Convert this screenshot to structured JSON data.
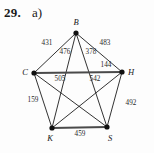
{
  "problem": {
    "number": "29.",
    "part": "a)"
  },
  "chart_data": {
    "type": "diagram",
    "title": "",
    "subtype": "weighted-complete-graph-K5",
    "vertices": [
      {
        "id": "B",
        "label": "B",
        "x": 76,
        "y": 33,
        "label_x": 76,
        "label_y": 25
      },
      {
        "id": "C",
        "label": "C",
        "x": 34,
        "y": 73,
        "label_x": 25,
        "label_y": 75
      },
      {
        "id": "H",
        "label": "H",
        "x": 122,
        "y": 72,
        "label_x": 131,
        "label_y": 75
      },
      {
        "id": "K",
        "label": "K",
        "x": 52,
        "y": 128,
        "label_x": 50,
        "label_y": 141
      },
      {
        "id": "S",
        "label": "S",
        "x": 107,
        "y": 127,
        "label_x": 110,
        "label_y": 141
      }
    ],
    "edges": [
      {
        "from": "B",
        "to": "C",
        "weight": "431",
        "label_x": 47,
        "label_y": 45,
        "style": "thin"
      },
      {
        "from": "B",
        "to": "H",
        "weight": "483",
        "label_x": 105,
        "label_y": 45,
        "style": "thin"
      },
      {
        "from": "B",
        "to": "K",
        "weight": "476",
        "label_x": 65,
        "label_y": 54,
        "style": "thin"
      },
      {
        "from": "B",
        "to": "S",
        "weight": "378",
        "label_x": 91,
        "label_y": 54,
        "style": "thin"
      },
      {
        "from": "C",
        "to": "H",
        "weight": "144",
        "label_x": 106,
        "label_y": 67,
        "style": "thick"
      },
      {
        "from": "C",
        "to": "S",
        "weight": "505",
        "label_x": 60,
        "label_y": 81,
        "style": "thin"
      },
      {
        "from": "C",
        "to": "K",
        "weight": "159",
        "label_x": 33,
        "label_y": 102,
        "style": "thin"
      },
      {
        "from": "H",
        "to": "K",
        "weight": "542",
        "label_x": 95,
        "label_y": 81,
        "style": "thin"
      },
      {
        "from": "H",
        "to": "S",
        "weight": "492",
        "label_x": 131,
        "label_y": 105,
        "style": "thin"
      },
      {
        "from": "K",
        "to": "S",
        "weight": "459",
        "label_x": 80,
        "label_y": 136,
        "style": "thick"
      }
    ],
    "edge_count": 10,
    "vertex_count": 5
  }
}
